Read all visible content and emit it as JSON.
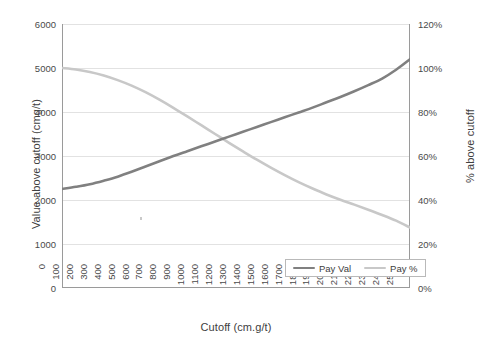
{
  "chart_data": {
    "type": "line",
    "title": "",
    "xlabel": "Cutoff (cm.g/t)",
    "ylabel": "Value above cutoff (cmg/t)",
    "y2label": "% above cutoff",
    "grid": true,
    "legend_position": "bottom-right",
    "xlim": [
      0,
      2500
    ],
    "ylim": [
      0,
      6000
    ],
    "y2lim": [
      0,
      120
    ],
    "xticks": [
      0,
      100,
      200,
      300,
      400,
      500,
      600,
      700,
      800,
      900,
      1000,
      1100,
      1200,
      1300,
      1400,
      1500,
      1600,
      1700,
      1800,
      1900,
      2000,
      2100,
      2200,
      2300,
      2400,
      2500
    ],
    "xticklabels": [
      "0",
      "100",
      "200",
      "300",
      "400",
      "500",
      "600",
      "700",
      "800",
      "900",
      "1000",
      "1100",
      "1200",
      "1300",
      "1400",
      "1500",
      "1600",
      "1700",
      "1800",
      "1900",
      "2000",
      "2100",
      "2200",
      "2300",
      "2400",
      "2500"
    ],
    "yticks": [
      0,
      1000,
      2000,
      3000,
      4000,
      5000,
      6000
    ],
    "yticklabels": [
      "0",
      "1000",
      "2000",
      "3000",
      "4000",
      "5000",
      "6000"
    ],
    "y2ticks": [
      0,
      20,
      40,
      60,
      80,
      100,
      120
    ],
    "y2ticklabels": [
      "0%",
      "20%",
      "40%",
      "60%",
      "80%",
      "100%",
      "120%"
    ],
    "x": [
      0,
      100,
      200,
      300,
      400,
      500,
      600,
      700,
      800,
      900,
      1000,
      1100,
      1200,
      1300,
      1400,
      1500,
      1600,
      1700,
      1800,
      1900,
      2000,
      2100,
      2200,
      2300,
      2400,
      2500
    ],
    "series": [
      {
        "name": "Pay Val",
        "axis": "left",
        "color": "#808080",
        "values": [
          2250,
          2300,
          2360,
          2440,
          2530,
          2640,
          2760,
          2880,
          3000,
          3110,
          3220,
          3330,
          3440,
          3550,
          3660,
          3770,
          3880,
          3990,
          4100,
          4220,
          4340,
          4470,
          4610,
          4760,
          4960,
          5200
        ]
      },
      {
        "name": "Pay %",
        "axis": "right",
        "color": "#c8c8c8",
        "values": [
          100,
          99.3,
          98.2,
          96.6,
          94.5,
          92.0,
          89.0,
          85.6,
          81.9,
          78.0,
          74.0,
          70.0,
          66.0,
          62.1,
          58.3,
          54.7,
          51.3,
          48.1,
          45.2,
          42.5,
          40.1,
          37.9,
          35.6,
          33.2,
          30.6,
          27.5
        ]
      }
    ]
  },
  "legend": {
    "entries": [
      {
        "label": "Pay Val",
        "color": "#808080"
      },
      {
        "label": "Pay %",
        "color": "#c8c8c8"
      }
    ]
  },
  "axes": {
    "x_title": "Cutoff (cm.g/t)",
    "y_left_title": "Value above cutoff (cmg/t)",
    "y_right_title": "% above cutoff"
  }
}
